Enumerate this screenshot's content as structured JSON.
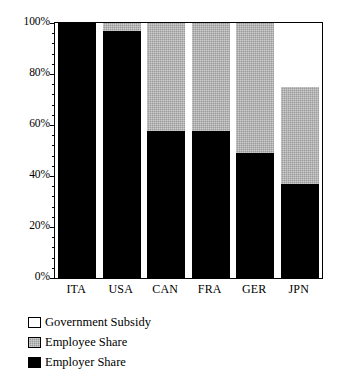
{
  "chart_data": {
    "type": "bar",
    "subtype": "stacked-bar-100-percent",
    "title": "",
    "subtitle": "",
    "xlabel": "",
    "ylabel": "",
    "categories": [
      "ITA",
      "USA",
      "CAN",
      "FRA",
      "GER",
      "JPN"
    ],
    "series": [
      {
        "name": "Employer Share",
        "color": "#000000",
        "fill": "solid-black",
        "values": [
          100,
          97,
          57.5,
          57.5,
          49,
          37
        ]
      },
      {
        "name": "Employee Share",
        "color": "#9a9a9a",
        "fill": "gray-hatch",
        "values": [
          0,
          3,
          42.5,
          42.5,
          51,
          38
        ]
      },
      {
        "name": "Government Subsidy",
        "color": "#ffffff",
        "fill": "white",
        "values": [
          0,
          0,
          0,
          0,
          0,
          25
        ]
      }
    ],
    "stack_order_bottom_to_top": [
      "Employer Share",
      "Employee Share",
      "Government Subsidy"
    ],
    "ylim": [
      0,
      100
    ],
    "yticks": [
      0,
      20,
      40,
      60,
      80,
      100
    ],
    "ytick_labels": [
      "0%",
      "20%",
      "40%",
      "60%",
      "80%",
      "100%"
    ],
    "y_minor_tick_interval": 4,
    "grid": false,
    "legend_position": "below-plot-left",
    "legend_entries": [
      {
        "label": "Government Subsidy",
        "swatch": "white"
      },
      {
        "label": "Employee Share",
        "swatch": "gray-hatch"
      },
      {
        "label": "Employer Share",
        "swatch": "black"
      }
    ],
    "annotations": []
  },
  "axes": {
    "y_tick_labels": [
      {
        "text": "100%",
        "value": 100
      },
      {
        "text": "80%",
        "value": 80
      },
      {
        "text": "60%",
        "value": 60
      },
      {
        "text": "40%",
        "value": 40
      },
      {
        "text": "20%",
        "value": 20
      },
      {
        "text": "0%",
        "value": 0
      }
    ],
    "x_tick_labels": [
      "ITA",
      "USA",
      "CAN",
      "FRA",
      "GER",
      "JPN"
    ]
  },
  "legend": {
    "items": [
      {
        "label": "Government Subsidy"
      },
      {
        "label": "Employee Share"
      },
      {
        "label": "Employer Share"
      }
    ]
  },
  "colors": {
    "employer": "#000000",
    "employee": "#9a9a9a",
    "subsidy": "#ffffff",
    "axis": "#000000",
    "background": "#ffffff"
  }
}
